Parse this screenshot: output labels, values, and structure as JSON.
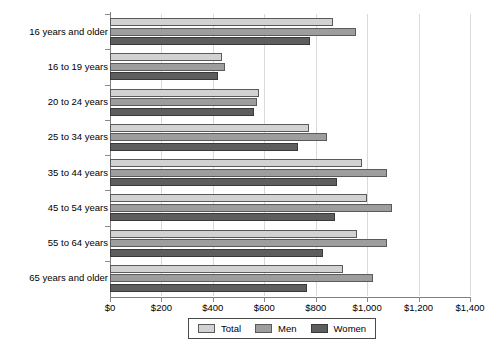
{
  "chart_data": {
    "type": "bar",
    "orientation": "horizontal",
    "title": "",
    "xlabel": "",
    "ylabel": "",
    "xlim": [
      0,
      1400
    ],
    "xticks": [
      0,
      200,
      400,
      600,
      800,
      1000,
      1200,
      1400
    ],
    "xtick_labels": [
      "$0",
      "$200",
      "$400",
      "$600",
      "$800",
      "$1,000",
      "$1,200",
      "$1,400"
    ],
    "grid": true,
    "legend_position": "bottom",
    "categories": [
      "16 years and older",
      "16 to 19 years",
      "20 to 24 years",
      "25 to 34 years",
      "35 to 44 years",
      "45 to 54 years",
      "55 to 64 years",
      "65 years and older"
    ],
    "series": [
      {
        "name": "Total",
        "color": "#d2d2d2",
        "values": [
          868,
          434,
          581,
          772,
          979,
          999,
          962,
          905
        ]
      },
      {
        "name": "Men",
        "color": "#9d9d9d",
        "values": [
          957,
          447,
          571,
          843,
          1079,
          1096,
          1079,
          1022
        ]
      },
      {
        "name": "Women",
        "color": "#5e5e5e",
        "values": [
          778,
          421,
          560,
          733,
          882,
          875,
          827,
          768
        ]
      }
    ]
  },
  "legend": {
    "items": [
      {
        "label": "Total",
        "key": "total"
      },
      {
        "label": "Men",
        "key": "men"
      },
      {
        "label": "Women",
        "key": "women"
      }
    ]
  }
}
